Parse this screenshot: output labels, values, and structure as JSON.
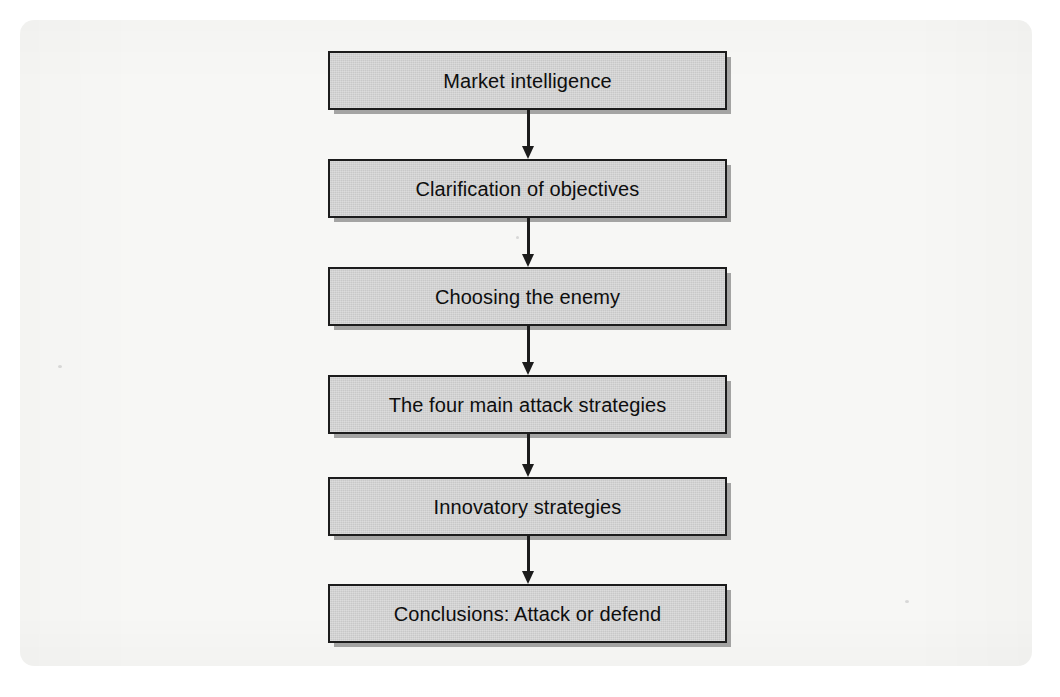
{
  "diagram": {
    "type": "flowchart",
    "orientation": "vertical",
    "title": "",
    "colors": {
      "node_fill": "#c8c8c8",
      "node_border": "#1c1c1c",
      "arrow": "#1c1c1c",
      "page_background": "#f7f7f5",
      "text": "#0e0e0e"
    },
    "nodes": [
      {
        "id": "node-1",
        "label": "Market intelligence"
      },
      {
        "id": "node-2",
        "label": "Clarification of objectives"
      },
      {
        "id": "node-3",
        "label": "Choosing the enemy"
      },
      {
        "id": "node-4",
        "label": "The four main attack strategies"
      },
      {
        "id": "node-5",
        "label": "Innovatory strategies"
      },
      {
        "id": "node-6",
        "label": "Conclusions: Attack or defend"
      }
    ],
    "connectors": [
      {
        "id": "arrow-1",
        "from": "node-1",
        "to": "node-2",
        "style": "solid-arrow-down"
      },
      {
        "id": "arrow-2",
        "from": "node-2",
        "to": "node-3",
        "style": "solid-arrow-down"
      },
      {
        "id": "arrow-3",
        "from": "node-3",
        "to": "node-4",
        "style": "solid-arrow-down"
      },
      {
        "id": "arrow-4",
        "from": "node-4",
        "to": "node-5",
        "style": "solid-arrow-down"
      },
      {
        "id": "arrow-5",
        "from": "node-5",
        "to": "node-6",
        "style": "solid-arrow-down"
      }
    ]
  }
}
